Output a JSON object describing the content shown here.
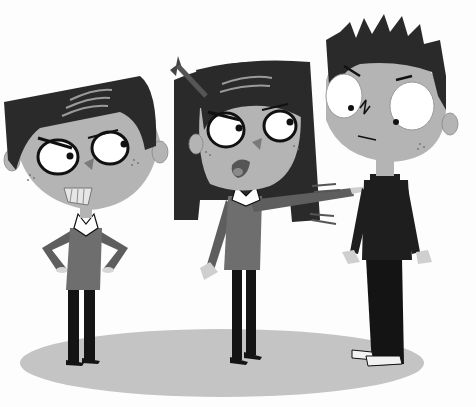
{
  "image": {
    "caption": "Cartoon illustration: three children, a girl pointing accusingly at a boy while another boy looks angry",
    "style": "grayscale flat cartoon",
    "colors": {
      "background": "#fdfdfd",
      "skin": "#b4b4b4",
      "hair": "#2a2a2a",
      "sweater_gray": "#6e6e6e",
      "sweater_black": "#1e1e1e",
      "pants": "#141414",
      "shadow": "#c4c4c4",
      "eye_white": "#ffffff",
      "outline": "#111111"
    }
  },
  "characters": [
    {
      "name": "angry-boy-left",
      "pose": "hands on hips, grimacing with clenched teeth",
      "expression": "angry"
    },
    {
      "name": "girl-center",
      "pose": "arm outstretched pointing right, other arm down",
      "expression": "angry, tongue out"
    },
    {
      "name": "boy-right",
      "pose": "arms at sides, spiky hair, black turtleneck",
      "expression": "nervous, sidelong glance"
    }
  ],
  "ground_shadow": {
    "shape": "ellipse",
    "description": "light gray floor shadow under all three characters"
  }
}
